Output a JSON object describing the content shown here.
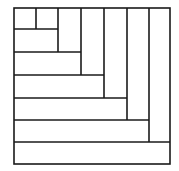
{
  "diagram": {
    "stroke_color": "#1a1a1a",
    "background": "#ffffff",
    "outer_box": {
      "x": 14,
      "y": 8,
      "w": 156,
      "h": 156
    },
    "segments": [
      {
        "x1": 36,
        "y1": 8,
        "x2": 36,
        "y2": 29
      },
      {
        "x1": 14,
        "y1": 29,
        "x2": 58,
        "y2": 29
      },
      {
        "x1": 58,
        "y1": 8,
        "x2": 58,
        "y2": 52
      },
      {
        "x1": 14,
        "y1": 52,
        "x2": 81,
        "y2": 52
      },
      {
        "x1": 81,
        "y1": 8,
        "x2": 81,
        "y2": 75
      },
      {
        "x1": 14,
        "y1": 75,
        "x2": 104,
        "y2": 75
      },
      {
        "x1": 104,
        "y1": 8,
        "x2": 104,
        "y2": 98
      },
      {
        "x1": 14,
        "y1": 98,
        "x2": 127,
        "y2": 98
      },
      {
        "x1": 127,
        "y1": 8,
        "x2": 127,
        "y2": 120
      },
      {
        "x1": 14,
        "y1": 120,
        "x2": 149,
        "y2": 120
      },
      {
        "x1": 149,
        "y1": 8,
        "x2": 149,
        "y2": 142
      },
      {
        "x1": 14,
        "y1": 142,
        "x2": 170,
        "y2": 142
      }
    ]
  }
}
